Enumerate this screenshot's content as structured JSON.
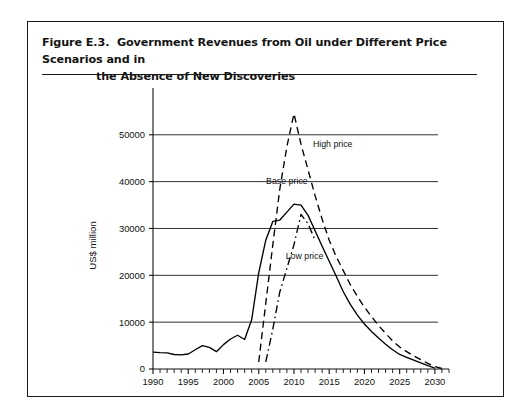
{
  "figure": {
    "label": "Figure E.3.",
    "title_line1": "Government Revenues from Oil under Different Price Scenarios and in",
    "title_line2": "the Absence of New Discoveries",
    "full_title": "Figure E.3.  Government Revenues from Oil under Different Price Scenarios and in the Absence of New Discoveries"
  },
  "chart_data": {
    "type": "line",
    "title": "",
    "xlabel": "",
    "ylabel": "US$ million",
    "xlim": [
      1990,
      2032
    ],
    "ylim": [
      0,
      57000
    ],
    "grid": true,
    "grid_axis": "y",
    "legend_position": "inline-annotations",
    "x_ticks_major": [
      1990,
      1995,
      2000,
      2005,
      2010,
      2015,
      2020,
      2025,
      2030
    ],
    "x_tick_labels": [
      "1990",
      "1995",
      "2000",
      "2005",
      "2010",
      "2015",
      "2020",
      "2025",
      "2030"
    ],
    "x_minor_tick_step": 1,
    "y_ticks": [
      0,
      10000,
      20000,
      30000,
      40000,
      50000
    ],
    "y_tick_labels": [
      "0",
      "10000",
      "20000",
      "30000",
      "40000",
      "50000"
    ],
    "series": [
      {
        "name": "Base price",
        "label": "Base price",
        "style": "solid",
        "color": "#000000",
        "x": [
          1990,
          1991,
          1992,
          1993,
          1994,
          1995,
          1996,
          1997,
          1998,
          1999,
          2000,
          2001,
          2002,
          2003,
          2004,
          2005,
          2006,
          2007,
          2008,
          2009,
          2010,
          2011,
          2012,
          2013,
          2014,
          2015,
          2016,
          2017,
          2018,
          2019,
          2020,
          2021,
          2022,
          2023,
          2024,
          2025,
          2026,
          2027,
          2028,
          2029,
          2030
        ],
        "values": [
          3600,
          3500,
          3450,
          3100,
          3000,
          3200,
          4100,
          5000,
          4600,
          3700,
          5200,
          6400,
          7200,
          6300,
          10500,
          20500,
          27500,
          31500,
          31800,
          33500,
          35200,
          35000,
          32800,
          29500,
          26200,
          23000,
          19800,
          16500,
          13800,
          11500,
          9600,
          8000,
          6600,
          5300,
          4100,
          3100,
          2500,
          1900,
          1300,
          700,
          200
        ]
      },
      {
        "name": "High price",
        "label": "High price",
        "style": "dashed",
        "color": "#000000",
        "x": [
          2005,
          2006,
          2007,
          2008,
          2009,
          2010,
          2011,
          2012,
          2013,
          2014,
          2015,
          2016,
          2017,
          2018,
          2019,
          2020,
          2021,
          2022,
          2023,
          2024,
          2025,
          2026,
          2027,
          2028,
          2029,
          2030,
          2031
        ],
        "values": [
          1500,
          14000,
          26500,
          38500,
          47500,
          54500,
          48000,
          42500,
          37000,
          32000,
          27500,
          24000,
          21000,
          18000,
          15500,
          13200,
          11200,
          9300,
          7600,
          6000,
          4700,
          3700,
          2800,
          2000,
          1200,
          500,
          100
        ]
      },
      {
        "name": "Low price",
        "label": "Low price",
        "style": "dashdot",
        "color": "#000000",
        "x": [
          2006,
          2007,
          2008,
          2009,
          2010,
          2011,
          2012,
          2013
        ],
        "values": [
          1500,
          8500,
          16500,
          21500,
          26500,
          33000,
          31000,
          27500
        ]
      }
    ],
    "annotations": [
      {
        "text": "High price",
        "x": 2015.5,
        "y": 47500
      },
      {
        "text": "Base price",
        "x": 2009.0,
        "y": 39500
      },
      {
        "text": "Low price",
        "x": 2011.5,
        "y": 23500
      }
    ]
  }
}
